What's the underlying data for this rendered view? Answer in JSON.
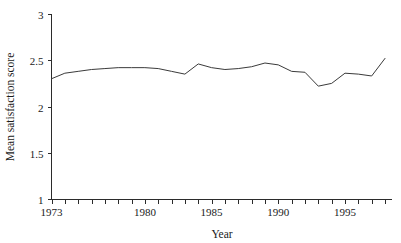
{
  "chart_data": {
    "type": "line",
    "title": "",
    "xlabel": "Year",
    "ylabel": "Mean satisfaction score",
    "xlim": [
      1973,
      1998
    ],
    "ylim": [
      1,
      3
    ],
    "grid": false,
    "legend": false,
    "x_tick_interval": 1,
    "x_tick_labels": [
      "1973",
      "1980",
      "1985",
      "1990",
      "1995"
    ],
    "x_tick_label_values": [
      1973,
      1980,
      1985,
      1990,
      1995
    ],
    "y_tick_labels": [
      "1",
      "1.5",
      "2",
      "2.5",
      "3"
    ],
    "y_tick_label_values": [
      1,
      1.5,
      2,
      2.5,
      3
    ],
    "line_color": "#3a3a3a",
    "axis_color": "#2b2b2b",
    "background_color": "#ffffff",
    "x": [
      1973,
      1974,
      1975,
      1976,
      1977,
      1978,
      1979,
      1980,
      1981,
      1982,
      1983,
      1984,
      1985,
      1986,
      1987,
      1988,
      1989,
      1990,
      1991,
      1992,
      1993,
      1994,
      1995,
      1996,
      1997,
      1998
    ],
    "values": [
      2.3,
      2.36,
      2.38,
      2.4,
      2.41,
      2.42,
      2.42,
      2.42,
      2.41,
      2.38,
      2.35,
      2.46,
      2.42,
      2.4,
      2.41,
      2.43,
      2.47,
      2.45,
      2.38,
      2.37,
      2.22,
      2.25,
      2.36,
      2.35,
      2.33,
      2.52
    ],
    "series": [
      {
        "name": "Mean satisfaction score",
        "values": [
          2.3,
          2.36,
          2.38,
          2.4,
          2.41,
          2.42,
          2.42,
          2.42,
          2.41,
          2.38,
          2.35,
          2.46,
          2.42,
          2.4,
          2.41,
          2.43,
          2.47,
          2.45,
          2.38,
          2.37,
          2.22,
          2.25,
          2.36,
          2.35,
          2.33,
          2.52
        ]
      }
    ]
  },
  "axes": {
    "x_title": "Year",
    "y_title": "Mean satisfaction score"
  }
}
